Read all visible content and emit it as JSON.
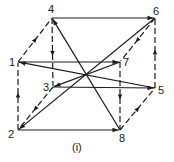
{
  "diagram": {
    "caption": "(i)",
    "colors": {
      "stroke": "#1a1a1a",
      "background": "#ffffff"
    },
    "vertices": [
      {
        "id": "1",
        "label": "1",
        "x": 18,
        "y": 62,
        "lx": 9,
        "ly": 66
      },
      {
        "id": "2",
        "label": "2",
        "x": 18,
        "y": 130,
        "lx": 8,
        "ly": 138
      },
      {
        "id": "3",
        "label": "3",
        "x": 53,
        "y": 87,
        "lx": 43,
        "ly": 91
      },
      {
        "id": "4",
        "label": "4",
        "x": 52,
        "y": 18,
        "lx": 48,
        "ly": 13
      },
      {
        "id": "5",
        "label": "5",
        "x": 155,
        "y": 88,
        "lx": 158,
        "ly": 94
      },
      {
        "id": "6",
        "label": "6",
        "x": 155,
        "y": 18,
        "lx": 153,
        "ly": 15
      },
      {
        "id": "7",
        "label": "7",
        "x": 120,
        "y": 62,
        "lx": 123,
        "ly": 66
      },
      {
        "id": "8",
        "label": "8",
        "x": 120,
        "y": 130,
        "lx": 119,
        "ly": 142
      }
    ],
    "edges": [
      {
        "from": "4",
        "to": "6",
        "style": "solid"
      },
      {
        "from": "1",
        "to": "4",
        "style": "dashed"
      },
      {
        "from": "4",
        "to": "3",
        "style": "dashed"
      },
      {
        "from": "8",
        "to": "4",
        "style": "solid"
      },
      {
        "from": "5",
        "to": "6",
        "style": "dashed"
      },
      {
        "from": "6",
        "to": "2",
        "style": "solid"
      },
      {
        "from": "6",
        "to": "7",
        "style": "dashed"
      },
      {
        "from": "1",
        "to": "7",
        "style": "solid"
      },
      {
        "from": "5",
        "to": "1",
        "style": "solid"
      },
      {
        "from": "3",
        "to": "5",
        "style": "solid"
      },
      {
        "from": "7",
        "to": "3",
        "style": "solid"
      },
      {
        "from": "3",
        "to": "2",
        "style": "dashed"
      },
      {
        "from": "2",
        "to": "1",
        "style": "dashed"
      },
      {
        "from": "2",
        "to": "8",
        "style": "solid"
      },
      {
        "from": "7",
        "to": "8",
        "style": "dashed"
      },
      {
        "from": "8",
        "to": "5",
        "style": "dashed"
      }
    ]
  }
}
